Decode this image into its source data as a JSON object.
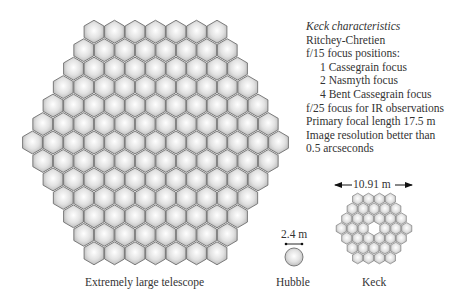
{
  "labels": {
    "elt": "Extremely large telescope",
    "hubble": "Hubble",
    "keck": "Keck",
    "hubble_size": "2.4 m",
    "keck_size": "10.91 m"
  },
  "keck_characteristics": {
    "title": "Keck characteristics",
    "lines": [
      {
        "text": "Ritchey-Chretien",
        "indent": false
      },
      {
        "text": "f/15 focus positions:",
        "indent": false
      },
      {
        "text": "1 Cassegrain focus",
        "indent": true
      },
      {
        "text": "2 Nasmyth focus",
        "indent": true
      },
      {
        "text": "4 Bent Cassegrain focus",
        "indent": true
      },
      {
        "text": "f/25 focus for IR observations",
        "indent": false
      },
      {
        "text": "Primary focal length 17.5 m",
        "indent": false
      },
      {
        "text": "Image resolution better than",
        "indent": false
      },
      {
        "text": "0.5 arcseconds",
        "indent": false
      }
    ]
  },
  "mirrors": {
    "elt": {
      "rows": [
        7,
        8,
        9,
        10,
        11,
        12,
        13,
        12,
        11,
        10,
        9,
        8,
        7
      ],
      "cx": 155.5,
      "cy": 142.5,
      "hex_w": 20.5
    },
    "keck": {
      "rows": [
        4,
        5,
        6,
        7,
        6,
        5,
        4
      ],
      "cx": 374,
      "cy": 228.5,
      "hex_w": 10.9,
      "center_missing": true
    },
    "hubble": {
      "cx": 294,
      "cy": 257,
      "r": 9
    }
  },
  "colors": {
    "segment_fill_center": "#ffffff",
    "segment_fill_edge": "#b8b8b8",
    "segment_stroke": "#6e6e6e",
    "text": "#333333"
  }
}
